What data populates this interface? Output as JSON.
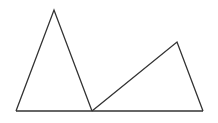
{
  "diagram": {
    "type": "geometry",
    "stroke_color": "#333333",
    "background": "#ffffff",
    "baseline": {
      "x1": 16,
      "y1": 111,
      "x2": 203,
      "y2": 111
    },
    "triangles": [
      {
        "name": "left-triangle",
        "points": [
          [
            16,
            111
          ],
          [
            54,
            10
          ],
          [
            92,
            111
          ]
        ]
      },
      {
        "name": "right-triangle",
        "points": [
          [
            92,
            111
          ],
          [
            177,
            42
          ],
          [
            203,
            111
          ]
        ]
      }
    ],
    "labels": []
  }
}
